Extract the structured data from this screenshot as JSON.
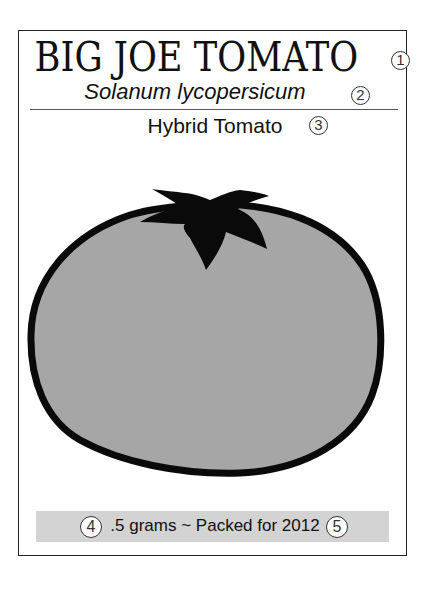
{
  "packet": {
    "title": "BIG JOE TOMATO",
    "scientific_name": "Solanum lycopersicum",
    "variety": "Hybrid Tomato",
    "footer": ".5 grams ~ Packed for 2012"
  },
  "callouts": [
    {
      "number": "1",
      "target": "title"
    },
    {
      "number": "2",
      "target": "scientific_name"
    },
    {
      "number": "3",
      "target": "variety"
    },
    {
      "number": "4",
      "target": "weight"
    },
    {
      "number": "5",
      "target": "packed_year"
    }
  ],
  "illustration": {
    "subject": "tomato-icon",
    "fill_color": "#a6a6a6",
    "outline_color": "#0a0a0a",
    "stem_color": "#0a0a0a"
  },
  "colors": {
    "footer_bar": "#d3d3d3",
    "border": "#222222"
  }
}
